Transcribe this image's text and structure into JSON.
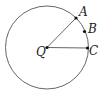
{
  "diagram": {
    "type": "circle-geometry",
    "circle": {
      "cx": 47,
      "cy": 47.5,
      "r": 41.5,
      "stroke": "#555555"
    },
    "center": {
      "label": "Q",
      "x": 47,
      "y": 47.5
    },
    "points": [
      {
        "label": "A",
        "x": 76,
        "y": 18
      },
      {
        "label": "B",
        "x": 84.5,
        "y": 31.5
      },
      {
        "label": "C",
        "x": 87.5,
        "y": 48
      }
    ],
    "segments": [
      {
        "from": "Q",
        "to": "A"
      },
      {
        "from": "Q",
        "to": "C"
      }
    ]
  }
}
